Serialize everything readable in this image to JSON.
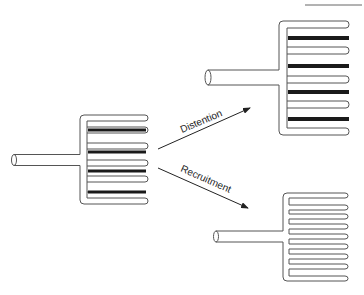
{
  "diagram": {
    "type": "capillary-recruitment-distention",
    "colors": {
      "stroke": "#555555",
      "perfused": "#1a1a1a",
      "background": "#ffffff"
    },
    "arrows": [
      {
        "label": "Distention"
      },
      {
        "label": "Recruitment"
      }
    ],
    "panels": [
      {
        "name": "baseline",
        "perfused_vessels": 4,
        "total_vessels": 8
      },
      {
        "name": "distention",
        "perfused_vessels": 4,
        "total_vessels": 8
      },
      {
        "name": "recruitment",
        "perfused_vessels": 0,
        "total_vessels": 9
      }
    ]
  }
}
